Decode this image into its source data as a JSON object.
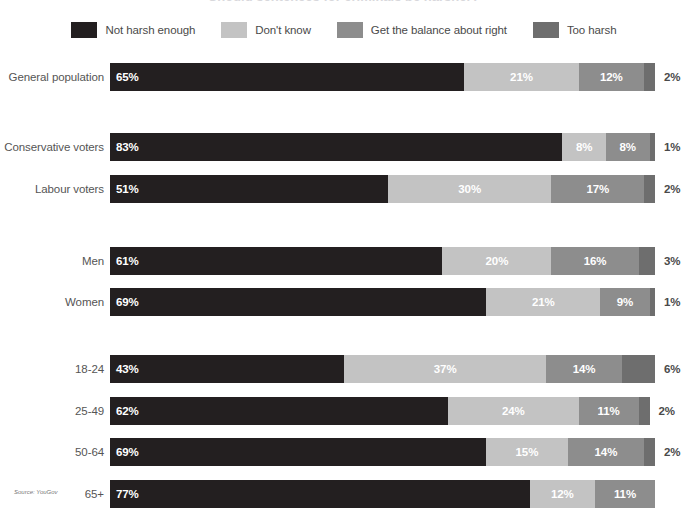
{
  "title": {
    "text": "Should sentences for criminals be harsher?"
  },
  "legend": {
    "items": [
      {
        "label": "Not harsh enough",
        "color": "#231f20",
        "swatch_name": "legend-swatch-not-harsh-enough"
      },
      {
        "label": "Don't know",
        "color": "#c3c3c3",
        "swatch_name": "legend-swatch-dont-know"
      },
      {
        "label": "Get the balance about right",
        "color": "#8d8d8d",
        "swatch_name": "legend-swatch-get-the-balance-about-right"
      },
      {
        "label": "Too harsh",
        "color": "#6e6e6e",
        "swatch_name": "legend-swatch-too-harsh"
      }
    ]
  },
  "source": {
    "text": "Source: YouGov"
  },
  "chart_data": {
    "type": "bar",
    "orientation": "horizontal",
    "stacked": true,
    "stack_total": 100,
    "unit": "%",
    "title": "Should sentences for criminals be harsher?",
    "xlabel": "",
    "ylabel": "",
    "xlim": [
      0,
      100
    ],
    "grid": false,
    "legend_position": "top",
    "categories": [
      "General population",
      "Conservative voters",
      "Labour voters",
      "Men",
      "Women",
      "18-24",
      "25-49",
      "50-64",
      "65+"
    ],
    "series": [
      {
        "name": "Not harsh enough",
        "color": "#231f20",
        "values": [
          65,
          83,
          51,
          61,
          69,
          43,
          62,
          69,
          77
        ]
      },
      {
        "name": "Don't know",
        "color": "#c3c3c3",
        "values": [
          21,
          8,
          30,
          20,
          21,
          37,
          24,
          15,
          12
        ]
      },
      {
        "name": "Get the balance about right",
        "color": "#8d8d8d",
        "values": [
          12,
          8,
          17,
          16,
          9,
          14,
          11,
          14,
          11
        ]
      },
      {
        "name": "Too harsh",
        "color": "#6e6e6e",
        "values": [
          2,
          1,
          2,
          3,
          1,
          6,
          2,
          2,
          0
        ]
      }
    ],
    "label_placement": {
      "inside_series": [
        "Not harsh enough",
        "Don't know",
        "Get the balance about right"
      ],
      "outside_series": [
        "Too harsh"
      ]
    }
  },
  "rows": [
    {
      "label": "General population",
      "group": 0,
      "segments": [
        {
          "series": "Not harsh enough",
          "value": 65,
          "display": "65%",
          "color": "#231f20",
          "inside": true
        },
        {
          "series": "Don't know",
          "value": 21,
          "display": "21%",
          "color": "#c3c3c3",
          "inside": true
        },
        {
          "series": "Get the balance about right",
          "value": 12,
          "display": "12%",
          "color": "#8d8d8d",
          "inside": true
        },
        {
          "series": "Too harsh",
          "value": 2,
          "display": "2%",
          "color": "#6e6e6e",
          "inside": false
        }
      ]
    },
    {
      "label": "Conservative voters",
      "group": 1,
      "segments": [
        {
          "series": "Not harsh enough",
          "value": 83,
          "display": "83%",
          "color": "#231f20",
          "inside": true
        },
        {
          "series": "Don't know",
          "value": 8,
          "display": "8%",
          "color": "#c3c3c3",
          "inside": true
        },
        {
          "series": "Get the balance about right",
          "value": 8,
          "display": "8%",
          "color": "#8d8d8d",
          "inside": true
        },
        {
          "series": "Too harsh",
          "value": 1,
          "display": "1%",
          "color": "#6e6e6e",
          "inside": false
        }
      ]
    },
    {
      "label": "Labour voters",
      "group": 1,
      "segments": [
        {
          "series": "Not harsh enough",
          "value": 51,
          "display": "51%",
          "color": "#231f20",
          "inside": true
        },
        {
          "series": "Don't know",
          "value": 30,
          "display": "30%",
          "color": "#c3c3c3",
          "inside": true
        },
        {
          "series": "Get the balance about right",
          "value": 17,
          "display": "17%",
          "color": "#8d8d8d",
          "inside": true
        },
        {
          "series": "Too harsh",
          "value": 2,
          "display": "2%",
          "color": "#6e6e6e",
          "inside": false
        }
      ]
    },
    {
      "label": "Men",
      "group": 2,
      "segments": [
        {
          "series": "Not harsh enough",
          "value": 61,
          "display": "61%",
          "color": "#231f20",
          "inside": true
        },
        {
          "series": "Don't know",
          "value": 20,
          "display": "20%",
          "color": "#c3c3c3",
          "inside": true
        },
        {
          "series": "Get the balance about right",
          "value": 16,
          "display": "16%",
          "color": "#8d8d8d",
          "inside": true
        },
        {
          "series": "Too harsh",
          "value": 3,
          "display": "3%",
          "color": "#6e6e6e",
          "inside": false
        }
      ]
    },
    {
      "label": "Women",
      "group": 2,
      "segments": [
        {
          "series": "Not harsh enough",
          "value": 69,
          "display": "69%",
          "color": "#231f20",
          "inside": true
        },
        {
          "series": "Don't know",
          "value": 21,
          "display": "21%",
          "color": "#c3c3c3",
          "inside": true
        },
        {
          "series": "Get the balance about right",
          "value": 9,
          "display": "9%",
          "color": "#8d8d8d",
          "inside": true
        },
        {
          "series": "Too harsh",
          "value": 1,
          "display": "1%",
          "color": "#6e6e6e",
          "inside": false
        }
      ]
    },
    {
      "label": "18-24",
      "group": 3,
      "segments": [
        {
          "series": "Not harsh enough",
          "value": 43,
          "display": "43%",
          "color": "#231f20",
          "inside": true
        },
        {
          "series": "Don't know",
          "value": 37,
          "display": "37%",
          "color": "#c3c3c3",
          "inside": true
        },
        {
          "series": "Get the balance about right",
          "value": 14,
          "display": "14%",
          "color": "#8d8d8d",
          "inside": true
        },
        {
          "series": "Too harsh",
          "value": 6,
          "display": "6%",
          "color": "#6e6e6e",
          "inside": false
        }
      ]
    },
    {
      "label": "25-49",
      "group": 3,
      "segments": [
        {
          "series": "Not harsh enough",
          "value": 62,
          "display": "62%",
          "color": "#231f20",
          "inside": true
        },
        {
          "series": "Don't know",
          "value": 24,
          "display": "24%",
          "color": "#c3c3c3",
          "inside": true
        },
        {
          "series": "Get the balance about right",
          "value": 11,
          "display": "11%",
          "color": "#8d8d8d",
          "inside": true
        },
        {
          "series": "Too harsh",
          "value": 2,
          "display": "2%",
          "color": "#6e6e6e",
          "inside": false
        }
      ]
    },
    {
      "label": "50-64",
      "group": 3,
      "segments": [
        {
          "series": "Not harsh enough",
          "value": 69,
          "display": "69%",
          "color": "#231f20",
          "inside": true
        },
        {
          "series": "Don't know",
          "value": 15,
          "display": "15%",
          "color": "#c3c3c3",
          "inside": true
        },
        {
          "series": "Get the balance about right",
          "value": 14,
          "display": "14%",
          "color": "#8d8d8d",
          "inside": true
        },
        {
          "series": "Too harsh",
          "value": 2,
          "display": "2%",
          "color": "#6e6e6e",
          "inside": false
        }
      ]
    },
    {
      "label": "65+",
      "group": 3,
      "segments": [
        {
          "series": "Not harsh enough",
          "value": 77,
          "display": "77%",
          "color": "#231f20",
          "inside": true
        },
        {
          "series": "Don't know",
          "value": 12,
          "display": "12%",
          "color": "#c3c3c3",
          "inside": true
        },
        {
          "series": "Get the balance about right",
          "value": 11,
          "display": "11%",
          "color": "#8d8d8d",
          "inside": true
        },
        {
          "series": "Too harsh",
          "value": 0,
          "display": "",
          "color": "#6e6e6e",
          "inside": false
        }
      ]
    }
  ],
  "layout": {
    "bar_left_px": 110,
    "bar_full_width_px": 545,
    "bar_height_px": 28,
    "row_tops_px": [
      8,
      78,
      120,
      192,
      233,
      300,
      342,
      383,
      425
    ]
  }
}
